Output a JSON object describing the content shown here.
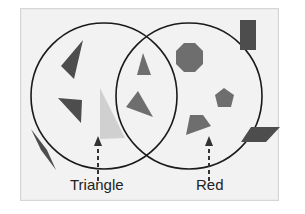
{
  "diagram": {
    "type": "venn",
    "sets": [
      {
        "name": "triangle",
        "label": "Triangle"
      },
      {
        "name": "red",
        "label": "Red"
      }
    ],
    "colors": {
      "background": "#f2f2f2",
      "circle_stroke": "#1a1a1a",
      "red_shape": "#6e6e6e",
      "dark_shape": "#4d4d4d",
      "pale_shape": "#d0d0d0"
    },
    "shapes": [
      {
        "shape": "triangle",
        "color": "dark",
        "region": "triangle-only"
      },
      {
        "shape": "triangle",
        "color": "dark",
        "region": "triangle-only"
      },
      {
        "shape": "triangle",
        "color": "pale",
        "region": "triangle-only"
      },
      {
        "shape": "triangle",
        "color": "red",
        "region": "intersection"
      },
      {
        "shape": "triangle",
        "color": "red",
        "region": "intersection"
      },
      {
        "shape": "octagon",
        "color": "red",
        "region": "red-only"
      },
      {
        "shape": "pentagon",
        "color": "red",
        "region": "red-only"
      },
      {
        "shape": "trapezoid",
        "color": "red",
        "region": "red-only"
      },
      {
        "shape": "rectangle",
        "color": "dark",
        "region": "outside"
      },
      {
        "shape": "parallelogram",
        "color": "dark",
        "region": "outside"
      },
      {
        "shape": "rhombus",
        "color": "dark",
        "region": "outside"
      }
    ]
  }
}
